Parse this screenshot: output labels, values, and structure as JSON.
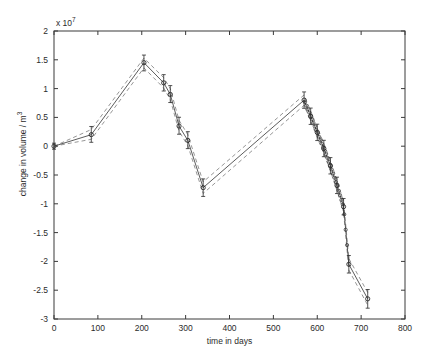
{
  "axes": {
    "exponent_label": "x 10",
    "exponent_power": "7",
    "xlabel": "time in days",
    "ylabel_prefix": "change in volume / m",
    "ylabel_power": "3",
    "xticks": [
      "0",
      "100",
      "200",
      "300",
      "400",
      "500",
      "600",
      "700",
      "800"
    ],
    "yticks": [
      "2",
      "1.5",
      "1",
      "0.5",
      "0",
      "-0.5",
      "-1",
      "-1.5",
      "-2",
      "-2.5",
      "-3"
    ]
  },
  "style": {
    "axis_color": "#3a3a3a",
    "line_color": "#4a4a4a",
    "dash_color": "#8a8a8a",
    "marker_color": "#2a2a2a"
  },
  "chart_data": {
    "type": "line",
    "title": "",
    "xlabel": "time in days",
    "ylabel": "change in volume / m^3",
    "xlim": [
      0,
      800
    ],
    "ylim": [
      -30000000,
      20000000
    ],
    "y_exponent": 10000000.0,
    "xticks": [
      0,
      100,
      200,
      300,
      400,
      500,
      600,
      700,
      800
    ],
    "yticks": [
      -30000000,
      -25000000,
      -20000000,
      -15000000,
      -10000000,
      -5000000,
      0,
      5000000,
      10000000,
      15000000,
      20000000
    ],
    "grid": false,
    "legend": null,
    "marker": "circle",
    "errorbars": true,
    "series": [
      {
        "name": "mean",
        "style": "solid",
        "x": [
          0,
          85,
          205,
          250,
          265,
          285,
          305,
          340,
          570,
          585,
          600,
          615,
          630,
          645,
          660,
          672,
          715
        ],
        "values": [
          0,
          2000000,
          14500000,
          11000000,
          9000000,
          3500000,
          1000000,
          -7200000,
          8000000,
          5200000,
          2400000,
          -400000,
          -3400000,
          -6800000,
          -10500000,
          -20500000,
          -26500000
        ]
      },
      {
        "name": "upper bound",
        "style": "dashed",
        "x": [
          0,
          85,
          205,
          250,
          265,
          285,
          305,
          340,
          570,
          585,
          600,
          615,
          630,
          645,
          660,
          672,
          715
        ],
        "values": [
          0,
          2900000,
          15300000,
          11900000,
          10000000,
          4500000,
          2000000,
          -6200000,
          8900000,
          6100000,
          3300000,
          500000,
          -2500000,
          -5900000,
          -9600000,
          -19500000,
          -25400000
        ]
      },
      {
        "name": "lower bound",
        "style": "dashed",
        "x": [
          0,
          85,
          205,
          250,
          265,
          285,
          305,
          340,
          570,
          585,
          600,
          615,
          630,
          645,
          660,
          672,
          715
        ],
        "values": [
          0,
          1200000,
          13600000,
          10100000,
          8100000,
          2600000,
          100000,
          -8200000,
          7100000,
          4300000,
          1500000,
          -1300000,
          -4300000,
          -7700000,
          -11400000,
          -21500000,
          -27600000
        ]
      }
    ],
    "dense_markers_x": [
      570,
      578,
      586,
      594,
      602,
      610,
      618,
      626,
      634,
      642,
      650,
      658,
      666,
      672,
      715
    ],
    "annotations": []
  }
}
